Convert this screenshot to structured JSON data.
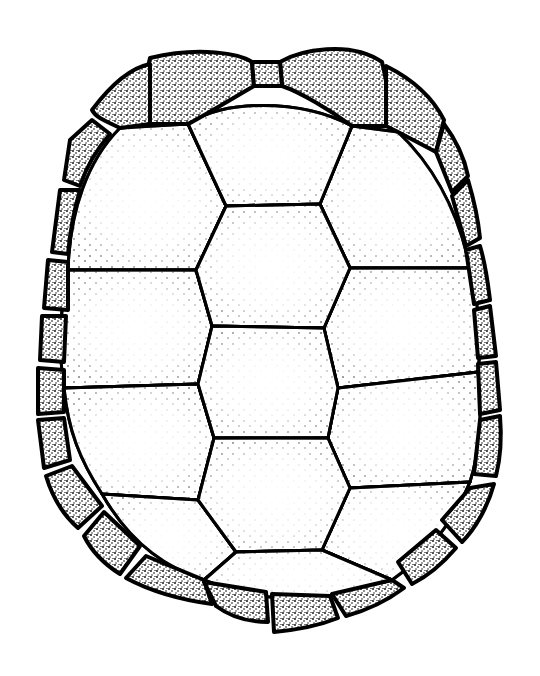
{
  "figure": {
    "background": "#ffffff",
    "ink": "#000000",
    "caption": ""
  },
  "shell": {
    "outline": "M150,58 C200,44 250,52 266,58 C290,48 350,38 382,62 C420,78 462,120 478,190 C492,250 500,330 502,420 C504,490 488,540 446,578 C410,610 360,630 300,636 C250,640 200,634 156,612 C110,590 66,550 48,500 C34,450 36,380 40,310 C46,230 62,160 92,110 C108,86 126,66 150,58 Z"
  },
  "scutes": {
    "nuchal": "M252,62 L280,62 L282,86 L254,86 Z",
    "vertebrals": [
      "M188,124 C220,100 300,98 352,126 L320,204 L226,206 Z",
      "M226,206 L320,204 L350,268 L324,328 L212,326 L196,270 Z",
      "M212,326 L324,328 L338,388 L328,438 L214,438 L198,384 Z",
      "M214,438 L328,438 L350,488 L322,550 L236,552 L198,500 Z",
      "M236,552 L322,550 L392,580 C340,604 270,606 204,580 Z"
    ],
    "costals_left": [
      "M120,128 L188,124 L226,206 L196,270 L68,270 C70,210 88,160 120,128 Z",
      "M68,270 L196,270 L212,326 L198,384 L64,388 C58,350 60,310 68,270 Z",
      "M64,388 L198,384 L214,438 L198,500 L102,494 C80,460 68,430 64,388 Z",
      "M102,494 L198,500 L236,552 L204,580 C160,566 126,536 102,494 Z"
    ],
    "costals_right": [
      "M352,126 L398,132 C438,170 460,220 470,268 L350,268 L320,204 Z",
      "M350,268 L470,268 C478,300 482,340 478,372 L338,388 L324,328 Z",
      "M338,388 L478,372 C482,410 480,450 470,482 L350,488 L328,438 Z",
      "M350,488 L470,482 C450,530 420,560 392,580 L322,550 Z"
    ],
    "marginals": [
      "M150,58 C200,46 240,54 252,62 L254,86 C230,100 200,118 188,124 L150,124 C146,100 144,80 150,58 Z",
      "M280,62 C300,50 350,40 382,62 C388,86 390,110 386,126 L352,126 C330,110 300,92 282,86 Z",
      "M92,110 C110,86 130,68 150,64 L150,124 L120,128 C108,122 96,118 92,110 Z",
      "M386,66 C410,78 432,96 444,120 L436,152 L398,132 L386,126 Z",
      "M70,140 L92,120 L110,134 C96,150 86,168 80,186 L64,180 Z",
      "M444,124 C456,140 464,156 468,176 L452,192 L436,152 Z",
      "M60,190 L80,190 C74,210 70,232 68,254 L52,252 Z",
      "M468,180 C474,200 478,218 480,238 L466,246 L452,196 Z",
      "M48,260 L68,262 L68,310 L44,308 Z",
      "M480,246 C486,266 488,284 490,300 L474,304 L466,250 Z",
      "M42,316 L66,316 L64,362 L40,360 Z",
      "M490,306 L496,356 L478,358 L474,310 Z",
      "M38,368 L64,370 L64,412 L38,414 Z",
      "M496,362 L500,410 L480,414 L478,364 Z",
      "M38,420 L64,418 L70,460 L44,468 Z",
      "M500,416 C502,440 500,460 496,476 L474,474 L480,420 Z",
      "M46,476 L72,466 L102,506 L78,528 C62,514 52,496 46,476 Z",
      "M494,484 C488,506 476,528 462,542 L442,520 L470,488 Z",
      "M84,536 L104,512 L140,546 L120,574 C104,564 92,552 84,536 Z",
      "M456,548 C444,562 428,576 412,584 L398,562 L436,530 Z",
      "M126,578 L146,556 L204,580 L212,604 C182,600 152,592 126,578 Z",
      "M404,588 C388,600 368,610 346,616 L332,594 L392,580 Z",
      "M216,606 L204,582 L266,592 L268,622 C248,622 232,618 216,606 Z",
      "M338,618 C318,626 296,630 274,632 L272,594 L330,596 Z"
    ]
  }
}
